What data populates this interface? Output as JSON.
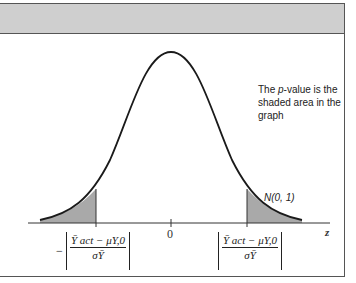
{
  "figure": {
    "caption": {
      "prefix": "The ",
      "italic": "p",
      "suffix": "-value is the shaded area in the graph"
    },
    "distribution_label": "N(0, 1)",
    "axis_label": "z",
    "zero_tick": "0",
    "left_bound": {
      "sign": "−",
      "numerator": "Ȳ act − μY,0",
      "denominator": "σȲ"
    },
    "right_bound": {
      "numerator": "Ȳ act − μY,0",
      "denominator": "σȲ"
    },
    "colors": {
      "header": "#cfcfcf",
      "shade": "#a9a9a9",
      "curve": "#1a1a1a",
      "border": "#555555"
    }
  }
}
